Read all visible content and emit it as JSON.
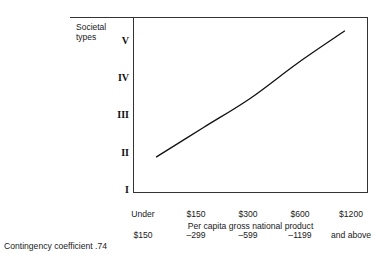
{
  "chart_data": {
    "type": "line",
    "title": "",
    "xlabel": "Per capita gross national product",
    "ylabel": "Societal types",
    "categories": [
      "Under\n$150",
      "$150\n–299",
      "$300\n–599",
      "$600\n–1199",
      "$1200\nand above"
    ],
    "x": [
      1,
      2,
      3,
      4,
      5
    ],
    "values": [
      1.72,
      2.45,
      3.18,
      4.05,
      4.85
    ],
    "ytick_labels": [
      "I",
      "II",
      "III",
      "IV",
      "V"
    ],
    "ytick_values": [
      1,
      2,
      3,
      4,
      5
    ],
    "ylim": [
      0.82,
      5.2
    ],
    "xlim": [
      0.5,
      5.5
    ],
    "grid": false,
    "legend": null,
    "line_color": "#111111",
    "annotations": [
      "Contingency coefficient .74"
    ]
  },
  "figure": {
    "y_axis_title": "Societal\ntypes",
    "x_axis_title": "Per capita gross national product",
    "caption": "Contingency coefficient .74",
    "y_ticks": [
      {
        "label": "V"
      },
      {
        "label": "IV"
      },
      {
        "label": "III"
      },
      {
        "label": "II"
      },
      {
        "label": "I"
      }
    ],
    "x_ticks": [
      {
        "line1": "Under",
        "line2": "$150"
      },
      {
        "line1": "$150",
        "line2": "–299"
      },
      {
        "line1": "$300",
        "line2": "–599"
      },
      {
        "line1": "$600",
        "line2": "–1199"
      },
      {
        "line1": "$1200",
        "line2": "and above"
      }
    ],
    "colors": {
      "axis": "#333333",
      "line": "#111111",
      "text": "#1a1a1a",
      "background": "#ffffff"
    }
  }
}
